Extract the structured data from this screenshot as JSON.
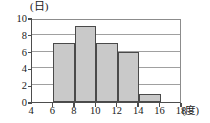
{
  "chart_data": {
    "type": "bar",
    "title": "",
    "subtitle": "",
    "xlabel": "(度)",
    "ylabel": "(日)",
    "xlim": [
      4,
      18
    ],
    "ylim": [
      0,
      10
    ],
    "grid": true,
    "legend": false,
    "bin_width": 2,
    "bin_edges": [
      4,
      6,
      8,
      10,
      12,
      14,
      16,
      18
    ],
    "categories": [
      "4-6",
      "6-8",
      "8-10",
      "10-12",
      "12-14",
      "14-16",
      "16-18"
    ],
    "values": [
      0,
      7,
      9,
      7,
      6,
      1,
      0
    ],
    "bars": [
      {
        "label": "6-8",
        "start": 6,
        "end": 8,
        "value": 7
      },
      {
        "label": "8-10",
        "start": 8,
        "end": 10,
        "value": 9
      },
      {
        "label": "10-12",
        "start": 10,
        "end": 12,
        "value": 7
      },
      {
        "label": "12-14",
        "start": 12,
        "end": 14,
        "value": 6
      },
      {
        "label": "14-16",
        "start": 14,
        "end": 16,
        "value": 1
      }
    ],
    "x_ticks": [
      "4",
      "6",
      "8",
      "10",
      "12",
      "14",
      "16",
      "18"
    ],
    "x_tick_values": [
      4,
      6,
      8,
      10,
      12,
      14,
      16,
      18
    ],
    "y_ticks": [
      "0",
      "2",
      "4",
      "6",
      "8",
      "10"
    ],
    "y_tick_values": [
      0,
      2,
      4,
      6,
      8,
      10
    ],
    "gridline_values": [
      2,
      4,
      6,
      8
    ],
    "colors": {
      "bar_fill": "#c9c9c9",
      "bar_border": "#4a4a4a",
      "axis": "#4d4d4d",
      "gridline": "#a0a0a0",
      "background": "#ffffff",
      "text": "#1a1a1a"
    }
  }
}
